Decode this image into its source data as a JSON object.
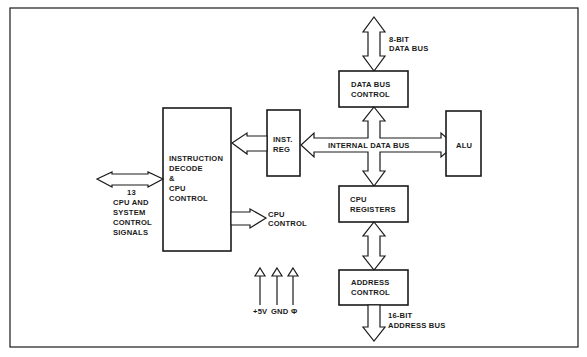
{
  "diagram": {
    "type": "block-diagram",
    "frame_color": "#1a1a1a",
    "background": "#ffffff",
    "blocks": {
      "instruction_decode": {
        "lines": [
          "INSTRUCTION",
          "DECODE",
          "&",
          "CPU",
          "CONTROL"
        ]
      },
      "inst_reg": {
        "lines": [
          "INST.",
          "REG"
        ]
      },
      "data_bus_control": {
        "lines": [
          "DATA BUS",
          "CONTROL"
        ]
      },
      "alu": {
        "lines": [
          "ALU"
        ]
      },
      "cpu_registers": {
        "lines": [
          "CPU",
          "REGISTERS"
        ]
      },
      "address_control": {
        "lines": [
          "ADDRESS",
          "CONTROL"
        ]
      }
    },
    "buses": {
      "external_data_bus": {
        "lines": [
          "8-BIT",
          "DATA BUS"
        ]
      },
      "internal_data_bus": {
        "label": "INTERNAL DATA BUS"
      },
      "address_bus": {
        "lines": [
          "16-BIT",
          "ADDRESS BUS"
        ]
      },
      "control_signals": {
        "lines": [
          "13",
          "CPU AND",
          "SYSTEM",
          "CONTROL",
          "SIGNALS"
        ]
      },
      "cpu_control_out": {
        "lines": [
          "CPU",
          "CONTROL"
        ]
      }
    },
    "power_inputs": {
      "labels": [
        "+5V",
        "GND",
        "Φ"
      ]
    },
    "connections": [
      [
        "external_data_bus",
        "data_bus_control"
      ],
      [
        "data_bus_control",
        "internal_data_bus"
      ],
      [
        "internal_data_bus",
        "inst_reg"
      ],
      [
        "internal_data_bus",
        "alu"
      ],
      [
        "internal_data_bus",
        "cpu_registers"
      ],
      [
        "inst_reg",
        "instruction_decode"
      ],
      [
        "instruction_decode",
        "control_signals"
      ],
      [
        "instruction_decode",
        "cpu_control_out"
      ],
      [
        "cpu_registers",
        "address_control"
      ],
      [
        "address_control",
        "address_bus"
      ]
    ]
  }
}
